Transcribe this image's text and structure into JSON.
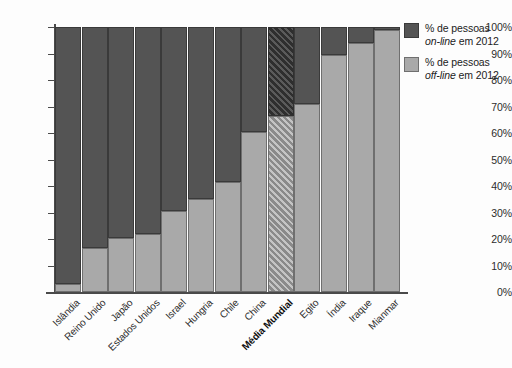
{
  "legend": {
    "position": "right",
    "entries": [
      {
        "line1": "% de pessoas",
        "line2_italic": "on-line",
        "line2_rest": " em 2012",
        "color": "#545454",
        "key": "online"
      },
      {
        "line1": "% de pessoas",
        "line2_italic": "off-line",
        "line2_rest": " em 2012",
        "color": "#a9a9a9",
        "key": "offline"
      }
    ]
  },
  "axis": {
    "y_ticks": [
      "0%",
      "10%",
      "20%",
      "30%",
      "40%",
      "50%",
      "60%",
      "70%",
      "80%",
      "90%",
      "100%"
    ]
  },
  "chart_data": {
    "type": "bar",
    "subtype": "stacked-100-percent",
    "title": "",
    "subtitle": "",
    "xlabel": "",
    "ylabel": "",
    "ylim": [
      0,
      100
    ],
    "yticks": [
      0,
      10,
      20,
      30,
      40,
      50,
      60,
      70,
      80,
      90,
      100
    ],
    "ytick_labels": [
      "0%",
      "10%",
      "20%",
      "30%",
      "40%",
      "50%",
      "60%",
      "70%",
      "80%",
      "90%",
      "100%"
    ],
    "grid": false,
    "legend_position": "right",
    "categories": [
      "Islândia",
      "Reino Unido",
      "Japão",
      "Estados Unidos",
      "Israel",
      "Hungria",
      "Chile",
      "China",
      "Média Mundial",
      "Egito",
      "Índia",
      "Iraque",
      "Mianmar"
    ],
    "highlight_category": "Média Mundial",
    "series": [
      {
        "name": "% de pessoas off-line em 2012",
        "key": "offline",
        "color": "#a9a9a9",
        "values": [
          3,
          16.5,
          20.5,
          22,
          30.5,
          35,
          41.5,
          60.5,
          66.5,
          71,
          89.5,
          94,
          99
        ]
      },
      {
        "name": "% de pessoas on-line em 2012",
        "key": "online",
        "color": "#545454",
        "values": [
          97,
          83.5,
          79.5,
          78,
          69.5,
          65,
          58.5,
          39.5,
          33.5,
          29,
          10.5,
          6,
          1
        ]
      }
    ]
  }
}
